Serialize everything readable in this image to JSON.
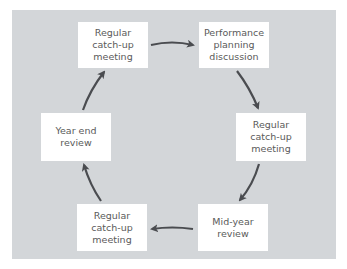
{
  "diagram": {
    "type": "cycle",
    "colors": {
      "panel": "#d3d6d9",
      "box": "#ffffff",
      "arrow": "#4a4c50",
      "text": "#5a5a5a"
    },
    "nodes": [
      {
        "id": "n1",
        "lines": [
          "Regular",
          "catch-up",
          "meeting"
        ]
      },
      {
        "id": "n2",
        "lines": [
          "Performance",
          "planning",
          "discussion"
        ]
      },
      {
        "id": "n3",
        "lines": [
          "Regular",
          "catch-up",
          "meeting"
        ]
      },
      {
        "id": "n4",
        "lines": [
          "Mid-year",
          "review"
        ]
      },
      {
        "id": "n5",
        "lines": [
          "Regular",
          "catch-up",
          "meeting"
        ]
      },
      {
        "id": "n6",
        "lines": [
          "Year end",
          "review"
        ]
      }
    ],
    "edges": [
      {
        "from": "n1",
        "to": "n2"
      },
      {
        "from": "n2",
        "to": "n3"
      },
      {
        "from": "n3",
        "to": "n4"
      },
      {
        "from": "n4",
        "to": "n5"
      },
      {
        "from": "n5",
        "to": "n6"
      },
      {
        "from": "n6",
        "to": "n1"
      }
    ]
  }
}
